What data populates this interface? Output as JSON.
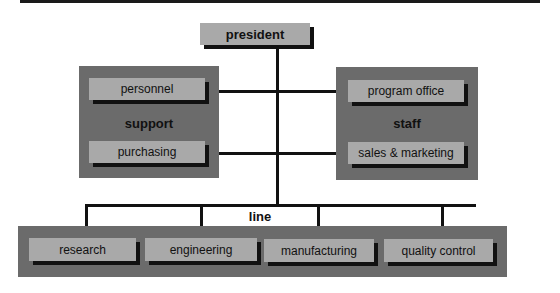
{
  "diagram": {
    "title_bar": true,
    "top": {
      "label": "president"
    },
    "support": {
      "label": "support",
      "items": [
        {
          "label": "personnel"
        },
        {
          "label": "purchasing"
        }
      ]
    },
    "staff": {
      "label": "staff",
      "items": [
        {
          "label": "program office"
        },
        {
          "label": "sales & marketing"
        }
      ]
    },
    "line": {
      "label": "line",
      "items": [
        {
          "label": "research"
        },
        {
          "label": "engineering"
        },
        {
          "label": "manufacturing"
        },
        {
          "label": "quality control"
        }
      ]
    },
    "colors": {
      "panel": "#6b6b6b",
      "box": "#a9a9a9",
      "connector": "#111111"
    }
  }
}
